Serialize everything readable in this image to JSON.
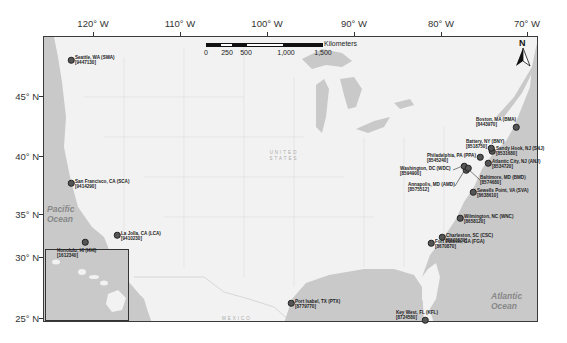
{
  "map": {
    "scalebar": {
      "unit": "Kilometers",
      "ticks": [
        "0",
        "250",
        "500",
        "1,000",
        "1,500"
      ]
    },
    "north_arrow": {
      "label": "N"
    },
    "longitude_labels": [
      "120° W",
      "110° W",
      "100° W",
      "90° W",
      "80° W",
      "70° W"
    ],
    "latitude_labels": [
      "45° N",
      "40° N",
      "35° N",
      "30° N",
      "25° N"
    ],
    "ocean_labels": {
      "pacific": "Pacific Ocean",
      "atlantic": "Atlantic Ocean"
    },
    "country_labels": {
      "usa": "UNITED STATES",
      "mexico": "MEXICO"
    },
    "colors": {
      "water": "#c9c9c9",
      "land": "#f2f2f2",
      "station_dot": "#555555"
    },
    "stations": [
      {
        "name": "Seattle, WA (SWA)",
        "id": "[9447130]"
      },
      {
        "name": "San Francisco, CA (SCA)",
        "id": "[9414290]"
      },
      {
        "name": "La Jolla, CA (LCA)",
        "id": "[9410230]"
      },
      {
        "name": "Honolulu, HI (HHI)",
        "id": "[1612340]"
      },
      {
        "name": "Port Isabel, TX (PTX)",
        "id": "[8779770]"
      },
      {
        "name": "Key West, FL (KFL)",
        "id": "[8724580]"
      },
      {
        "name": "Fort Pulaski, GA (FGA)",
        "id": "[8670870]"
      },
      {
        "name": "Charleston, SC (CSC)",
        "id": "[8665530]"
      },
      {
        "name": "Wilmington, NC (WNC)",
        "id": "[8658120]"
      },
      {
        "name": "Sewells Point, VA (SVA)",
        "id": "[8638610]"
      },
      {
        "name": "Annapolis, MD (AMD)",
        "id": "[8575512]"
      },
      {
        "name": "Washington, DC (WDC)",
        "id": "[8594900]"
      },
      {
        "name": "Baltimore, MD (BMD)",
        "id": "[8574680]"
      },
      {
        "name": "Philadelphia, PA (PPA)",
        "id": "[8545240]"
      },
      {
        "name": "Atlantic City, NJ (ANJ)",
        "id": "[8534720]"
      },
      {
        "name": "Sandy Hook, NJ (SNJ)",
        "id": "[8531680]"
      },
      {
        "name": "Battery, NY (BNY)",
        "id": "[8518750]"
      },
      {
        "name": "Boston, MA (BMA)",
        "id": "[8443970]"
      }
    ]
  }
}
